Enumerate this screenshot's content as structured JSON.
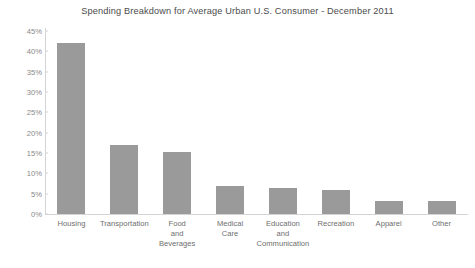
{
  "chart_data": {
    "type": "bar",
    "title": "Spending Breakdown for Average Urban U.S. Consumer - December 2011",
    "xlabel": "",
    "ylabel": "",
    "ylim": [
      0,
      45
    ],
    "ytick_step": 5,
    "grid": false,
    "legend": null,
    "bar_color": "#9a9a9a",
    "categories": [
      "Housing",
      "Transportation",
      "Food and Beverages",
      "Medical Care",
      "Education and Communication",
      "Recreation",
      "Apparel",
      "Other"
    ],
    "category_lines": [
      [
        "Housing"
      ],
      [
        "Transportation"
      ],
      [
        "Food",
        "and",
        "Beverages"
      ],
      [
        "Medical",
        "Care"
      ],
      [
        "Education",
        "and",
        "Communication"
      ],
      [
        "Recreation"
      ],
      [
        "Apparel"
      ],
      [
        "Other"
      ]
    ],
    "values": [
      42.0,
      17.0,
      15.3,
      6.9,
      6.4,
      5.9,
      3.2,
      3.2
    ],
    "ytick_labels": [
      "45%",
      "40%",
      "35%",
      "30%",
      "25%",
      "20%",
      "15%",
      "10%",
      "5%",
      "0%"
    ],
    "ytick_values": [
      45,
      40,
      35,
      30,
      25,
      20,
      15,
      10,
      5,
      0
    ]
  },
  "axis_color": "#d4d4d4",
  "tick_label_color": "#888888",
  "category_label_color": "#6e6e6e",
  "title_color": "#4a4a4a"
}
